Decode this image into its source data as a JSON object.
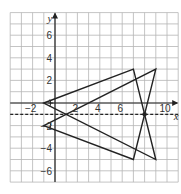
{
  "figure": {
    "type": "coordinate-grid-reflection",
    "grid": {
      "x_min": -4,
      "x_max": 11,
      "y_min": -7,
      "y_max": 8,
      "step": 1
    },
    "axes": {
      "x_label": "x",
      "y_label": "y",
      "x_tick_labels": [
        {
          "value": -2,
          "text": "−2"
        },
        {
          "value": 2,
          "text": "2"
        },
        {
          "value": 4,
          "text": "4"
        },
        {
          "value": 6,
          "text": "6"
        },
        {
          "value": 10,
          "text": "10"
        }
      ],
      "y_tick_labels": [
        {
          "value": 6,
          "text": "6"
        },
        {
          "value": 4,
          "text": "4"
        },
        {
          "value": 2,
          "text": "2"
        },
        {
          "value": -2,
          "text": "−2"
        },
        {
          "value": -4,
          "text": "−4"
        },
        {
          "value": -6,
          "text": "−6"
        }
      ]
    },
    "shapes": [
      {
        "name": "triangle-original",
        "vertices": [
          [
            -1,
            0
          ],
          [
            7,
            3
          ],
          [
            9,
            -5
          ]
        ]
      },
      {
        "name": "triangle-image",
        "vertices": [
          [
            -1,
            -2
          ],
          [
            9,
            3
          ],
          [
            7,
            -5
          ]
        ]
      }
    ],
    "mirror_line": {
      "equation": "y = -1",
      "style": "dashed"
    },
    "intersection_point": [
      8,
      -1
    ],
    "angle_marks": [
      [
        -1,
        0
      ],
      [
        -1,
        -2
      ]
    ],
    "colors": {
      "grid": "#b5b5b5",
      "lines": "#222222",
      "background": "#ffffff"
    }
  }
}
